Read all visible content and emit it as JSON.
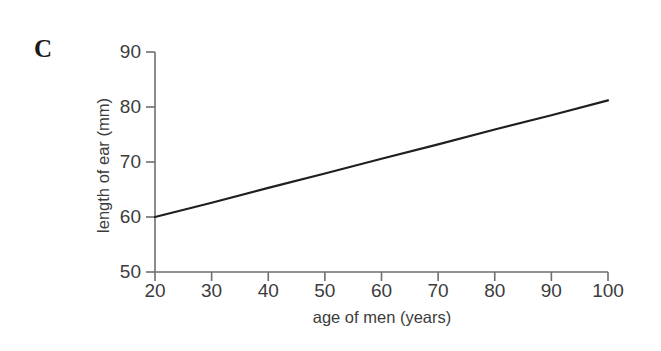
{
  "panel": {
    "label": "C"
  },
  "chart_data": {
    "type": "line",
    "title": "",
    "subtitle": "",
    "xlabel": "age of men (years)",
    "ylabel": "length of ear (mm)",
    "xlim": [
      20,
      100
    ],
    "ylim": [
      50,
      90
    ],
    "xticks": [
      20,
      30,
      40,
      50,
      60,
      70,
      80,
      90,
      100
    ],
    "xtick_labels": [
      "20",
      "30",
      "40",
      "50",
      "60",
      "70",
      "80",
      "90",
      "100"
    ],
    "yticks": [
      50,
      60,
      70,
      80,
      90
    ],
    "ytick_labels": [
      "50",
      "60",
      "70",
      "80",
      "90"
    ],
    "grid": false,
    "legend": null,
    "annotations": [],
    "series": [
      {
        "name": "regression line",
        "color": "#1f1f1f",
        "linewidth": 2.2,
        "x": [
          20,
          30,
          40,
          50,
          60,
          70,
          80,
          90,
          100
        ],
        "values": [
          60.0,
          62.6,
          65.3,
          67.9,
          70.6,
          73.2,
          75.9,
          78.5,
          81.2
        ]
      }
    ]
  },
  "axes": {
    "line_color": "#6e6e6e",
    "tick_color": "#6e6e6e"
  }
}
